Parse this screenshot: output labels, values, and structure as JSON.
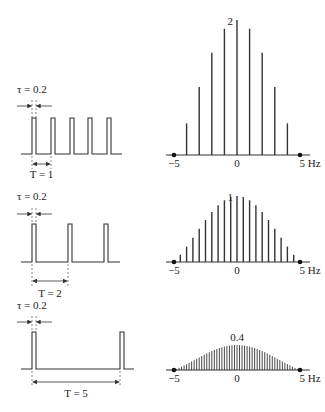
{
  "figure": {
    "rows": [
      {
        "pulse": {
          "tau_label": "τ = 0.2",
          "period_label": "T = 1",
          "tau": 0.2,
          "period": 1,
          "pulse_x": [
            32,
            51,
            70,
            88,
            107
          ],
          "top_y": 118,
          "base_y": 154,
          "line_x": [
            21,
            122
          ],
          "arrow_y": 164,
          "period_end_x": 51,
          "label_y": 93,
          "tau_arrow_y": 106,
          "period_label_y": 178
        },
        "spectrum": {
          "peak_label": "2",
          "peak_value": 2,
          "spacing_hz": 1,
          "base_y": 155,
          "peak_y": 20,
          "axis_labels": {
            "left": "−5",
            "center": "0",
            "right": "5 Hz"
          }
        }
      },
      {
        "pulse": {
          "tau_label": "τ = 0.2",
          "period_label": "T = 2",
          "tau": 0.2,
          "period": 2,
          "pulse_x": [
            32,
            68,
            104
          ],
          "top_y": 224,
          "base_y": 262,
          "line_x": [
            21,
            120
          ],
          "arrow_y": 281,
          "period_end_x": 68,
          "label_y": 200,
          "tau_arrow_y": 214,
          "period_label_y": 297
        },
        "spectrum": {
          "peak_label": "1",
          "peak_value": 1,
          "spacing_hz": 0.5,
          "base_y": 262,
          "peak_y": 196,
          "axis_labels": {
            "left": "−5",
            "center": "0",
            "right": "5 Hz"
          }
        }
      },
      {
        "pulse": {
          "tau_label": "τ = 0.2",
          "period_label": "T = 5",
          "tau": 0.2,
          "period": 5,
          "pulse_x": [
            32,
            120
          ],
          "top_y": 332,
          "base_y": 369,
          "line_x": [
            21,
            134
          ],
          "arrow_y": 382,
          "period_end_x": 120,
          "label_y": 309,
          "tau_arrow_y": 322,
          "period_label_y": 397
        },
        "spectrum": {
          "peak_label": "0.4",
          "peak_value": 0.4,
          "spacing_hz": 0.2,
          "base_y": 370,
          "peak_y": 345,
          "axis_labels": {
            "left": "−5",
            "center": "0",
            "right": "5 Hz"
          }
        }
      }
    ],
    "spectrum_axis": {
      "x_min_hz": -5,
      "x_max_hz": 5,
      "px_left": 174,
      "px_right": 300
    },
    "colors": {
      "ink": "#333333",
      "background": "#ffffff"
    }
  }
}
